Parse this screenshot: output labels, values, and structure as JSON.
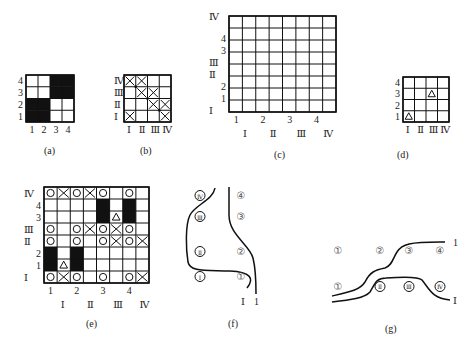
{
  "colors": {
    "ink": "#111111",
    "background": "#ffffff"
  },
  "panels": {
    "a": {
      "caption": "(a)",
      "size": 4,
      "row_labels": [
        "4",
        "3",
        "2",
        "1"
      ],
      "col_labels": [
        "1",
        "2",
        "3",
        "4"
      ],
      "cells": [
        [
          "",
          "",
          "B",
          "B"
        ],
        [
          "",
          "",
          "B",
          "B"
        ],
        [
          "B",
          "B",
          "",
          ""
        ],
        [
          "B",
          "B",
          "",
          ""
        ]
      ]
    },
    "b": {
      "caption": "(b)",
      "size": 4,
      "row_labels": [
        "Ⅳ",
        "Ⅲ",
        "Ⅱ",
        "Ⅰ"
      ],
      "col_labels": [
        "Ⅰ",
        "Ⅱ",
        "Ⅲ",
        "Ⅳ"
      ],
      "cells": [
        [
          "X",
          "X",
          "",
          ""
        ],
        [
          "",
          "X",
          "X",
          ""
        ],
        [
          "",
          "",
          "X",
          "X"
        ],
        [
          "X",
          "",
          "",
          "X"
        ]
      ]
    },
    "c": {
      "caption": "(c)",
      "size": 8,
      "row_labels": [
        "Ⅳ",
        "4",
        "3",
        "Ⅲ",
        "Ⅱ",
        "2",
        "1",
        "Ⅰ"
      ],
      "col_labels_top": [
        "1",
        "2",
        "3",
        "4"
      ],
      "col_labels_bottom": [
        "Ⅰ",
        "Ⅱ",
        "Ⅲ",
        "Ⅳ"
      ]
    },
    "d": {
      "caption": "(d)",
      "size": 4,
      "row_labels": [
        "4",
        "3",
        "2",
        "1"
      ],
      "col_labels": [
        "Ⅰ",
        "Ⅱ",
        "Ⅲ",
        "Ⅳ"
      ],
      "cells": [
        [
          "",
          "",
          "",
          ""
        ],
        [
          "",
          "",
          "T",
          ""
        ],
        [
          "",
          "",
          "",
          ""
        ],
        [
          "T",
          "",
          "",
          ""
        ]
      ]
    },
    "e": {
      "caption": "(e)",
      "size": 8,
      "row_labels": [
        "Ⅳ",
        "4",
        "3",
        "Ⅲ",
        "Ⅱ",
        "2",
        "1",
        "Ⅰ"
      ],
      "col_labels_top": [
        "1",
        "2",
        "3",
        "4"
      ],
      "col_labels_bottom": [
        "Ⅰ",
        "Ⅱ",
        "Ⅲ",
        "Ⅳ"
      ],
      "cells": [
        [
          "O",
          "X",
          "O",
          "X",
          "O",
          "",
          "O",
          ""
        ],
        [
          "",
          "",
          "",
          "",
          "B",
          "",
          "B",
          ""
        ],
        [
          "",
          "",
          "",
          "",
          "B",
          "T",
          "B",
          ""
        ],
        [
          "O",
          "",
          "O",
          "X",
          "O",
          "X",
          "O",
          ""
        ],
        [
          "O",
          "",
          "O",
          "",
          "O",
          "X",
          "O",
          "X"
        ],
        [
          "B",
          "",
          "B",
          "",
          "",
          "",
          "",
          ""
        ],
        [
          "B",
          "T",
          "B",
          "",
          "",
          "",
          "",
          ""
        ],
        [
          "O",
          "X",
          "O",
          "",
          "O",
          "",
          "O",
          "X"
        ]
      ]
    },
    "f": {
      "caption": "(f)",
      "left_labels": [
        "Ⅳ",
        "Ⅲ",
        "Ⅱ",
        "Ⅰ"
      ],
      "right_labels": [
        "④",
        "③",
        "②",
        "①"
      ],
      "left_marks": [
        "Ⓘ",
        "Ⓘ",
        "Ⓘ",
        "①"
      ],
      "end_labels": [
        "Ⅰ",
        "1"
      ]
    },
    "g": {
      "caption": "(g)",
      "top_labels": [
        "①",
        "②",
        "③",
        "④"
      ],
      "bottom_labels": [
        "①",
        "Ⅱ",
        "Ⅲ",
        "Ⅳ"
      ],
      "end_labels": [
        "1",
        "Ⅰ"
      ]
    }
  }
}
